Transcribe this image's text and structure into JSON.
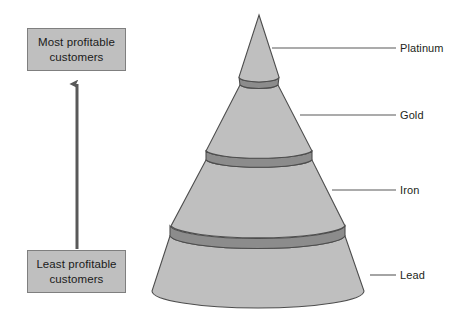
{
  "diagram": {
    "type": "customer-profitability-cone-pyramid",
    "background_color": "#ffffff",
    "axis": {
      "top_box": {
        "line1": "Most profitable",
        "line2": "customers",
        "fill_color": "#bfbfbf",
        "border_color": "#7f7f7f"
      },
      "bottom_box": {
        "line1": "Least profitable",
        "line2": "customers",
        "fill_color": "#bfbfbf",
        "border_color": "#7f7f7f"
      },
      "arrow": {
        "direction": "up",
        "color": "#595959"
      }
    },
    "cone": {
      "body_color": "#bfbfbf",
      "band_color": "#8c8c8c",
      "outline_color": "#4d4d4d"
    },
    "tiers": [
      {
        "label": "Platinum",
        "rank": 1
      },
      {
        "label": "Gold",
        "rank": 2
      },
      {
        "label": "Iron",
        "rank": 3
      },
      {
        "label": "Lead",
        "rank": 4
      }
    ],
    "leader_line_color": "#595959"
  }
}
